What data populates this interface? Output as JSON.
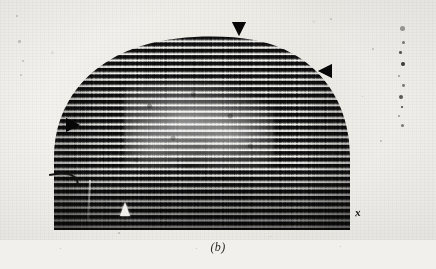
{
  "figure": {
    "caption": "(b)",
    "kind": "electron-micrograph-scan",
    "registration_mark": "x",
    "background_color": "#f1f0ec",
    "stripe_dark_color": "#0a0a0a",
    "stripe_light_color": "#f2f1ee",
    "plate": {
      "left": 46,
      "top": 30,
      "width": 312,
      "height": 200,
      "shape": "dome",
      "stripe_period_px": 6.4,
      "stripe_count": 31
    },
    "annotations": [
      {
        "id": "marker-top",
        "label": "arrowhead-down",
        "direction": "down",
        "color": "#070707",
        "x": 232,
        "y": 22
      },
      {
        "id": "marker-right",
        "label": "arrowhead-left",
        "direction": "left",
        "color": "#070707",
        "x": 318,
        "y": 64
      },
      {
        "id": "marker-left",
        "label": "arrowhead-right",
        "direction": "right",
        "color": "#070707",
        "x": 66,
        "y": 118
      },
      {
        "id": "marker-bottom",
        "label": "arrowhead-up-white",
        "direction": "up",
        "color": "#f4f3f0",
        "x": 120,
        "y": 202
      }
    ],
    "edge_specks": [
      {
        "x": 4,
        "y": 8,
        "d": 5.0
      },
      {
        "x": 6,
        "y": 23,
        "d": 3.2
      },
      {
        "x": 3,
        "y": 33,
        "d": 2.6
      },
      {
        "x": 5,
        "y": 44,
        "d": 3.8
      },
      {
        "x": 2,
        "y": 57,
        "d": 2.2
      },
      {
        "x": 6,
        "y": 66,
        "d": 2.8
      },
      {
        "x": 3,
        "y": 77,
        "d": 4.4
      },
      {
        "x": 5,
        "y": 88,
        "d": 2.4
      },
      {
        "x": 2,
        "y": 97,
        "d": 2.0
      },
      {
        "x": 5,
        "y": 106,
        "d": 3.0
      }
    ],
    "dust_specks": [
      {
        "x": 18,
        "y": 40,
        "d": 2.6
      },
      {
        "x": 22,
        "y": 60,
        "d": 1.8
      },
      {
        "x": 20,
        "y": 74,
        "d": 2.4
      },
      {
        "x": 16,
        "y": 15,
        "d": 1.6
      },
      {
        "x": 330,
        "y": 18,
        "d": 1.8
      },
      {
        "x": 372,
        "y": 48,
        "d": 1.6
      },
      {
        "x": 362,
        "y": 96,
        "d": 1.4
      },
      {
        "x": 380,
        "y": 140,
        "d": 1.6
      },
      {
        "x": 118,
        "y": 232,
        "d": 1.6
      },
      {
        "x": 270,
        "y": 236,
        "d": 1.4
      },
      {
        "x": 196,
        "y": 248,
        "d": 1.4
      },
      {
        "x": 60,
        "y": 248,
        "d": 1.2
      },
      {
        "x": 340,
        "y": 246,
        "d": 1.2
      }
    ]
  }
}
